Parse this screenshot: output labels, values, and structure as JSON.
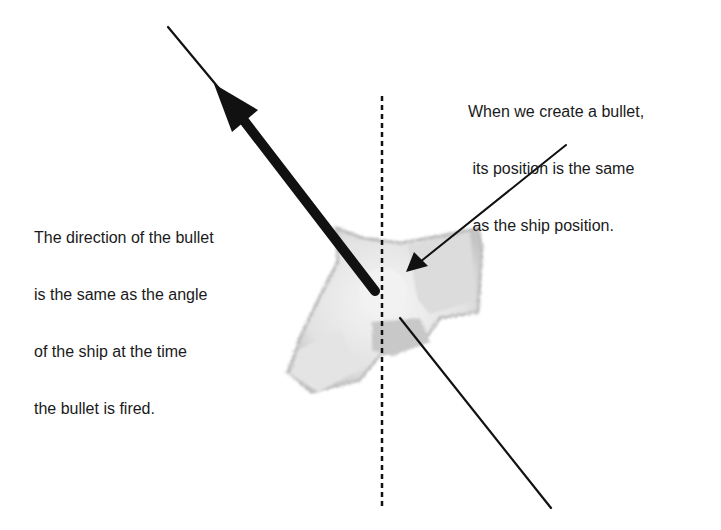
{
  "diagram": {
    "annotations": {
      "position_note": {
        "lines": [
          "When we create a bullet,",
          " its position is the same",
          " as the ship position."
        ]
      },
      "direction_note": {
        "lines": [
          "The direction of the bullet",
          "is the same as the angle",
          "of the ship at the time",
          "the bullet is fired."
        ]
      }
    },
    "elements": {
      "ship": "ship-sprite",
      "direction_arrow": "bullet-direction-arrow",
      "angle_line": "ship-angle-line",
      "vertical_reference": "dotted-vertical-axis",
      "pointer_arrow": "position-pointer-arrow"
    },
    "colors": {
      "ink": "#111111",
      "ship_light": "#eeeeee",
      "ship_mid": "#d6d6d6",
      "ship_dark": "#b8b8b8",
      "background": "#ffffff"
    }
  }
}
